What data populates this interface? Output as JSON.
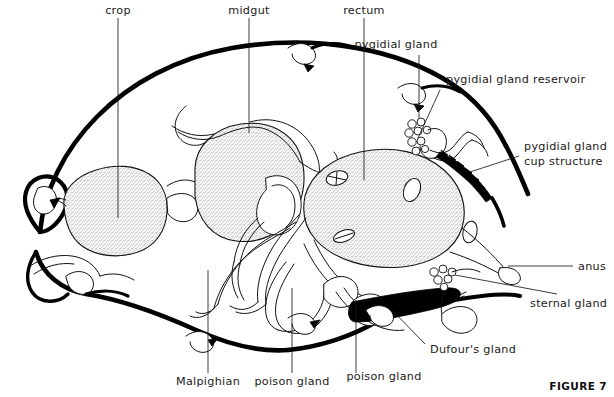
{
  "figure": {
    "caption": "FIGURE 7"
  },
  "labels": {
    "crop": "crop",
    "midgut": "midgut",
    "rectum": "rectum",
    "pygidial_gland": "pygidial gland",
    "pygidial_gland_reservoir": "pygidial gland  reservoir",
    "pygidial_gland_cup_line1": "pygidial gland",
    "pygidial_gland_cup_line2": "cup structure",
    "anus": "anus",
    "sternal_gland": "sternal gland",
    "dufours_gland": "Dufour's gland",
    "malpighian": "Malpighian",
    "poison_gland_left": "poison gland",
    "poison_gland_right": "poison gland"
  },
  "colors": {
    "ink": "#000000",
    "label_text": "#1a1a1a",
    "stipple_fill": "#d9d9d9",
    "background": "#ffffff",
    "solid_gland": "#000000"
  },
  "structures": [
    {
      "name": "crop",
      "fill": "stippled"
    },
    {
      "name": "midgut",
      "fill": "stippled"
    },
    {
      "name": "rectum",
      "fill": "stippled"
    },
    {
      "name": "pygidial-gland",
      "fill": "acinar-cluster"
    },
    {
      "name": "pygidial-gland-reservoir",
      "fill": "outline"
    },
    {
      "name": "pygidial-gland-cup-structure",
      "fill": "solid-black-serrated"
    },
    {
      "name": "sternal-gland",
      "fill": "acinar-cluster"
    },
    {
      "name": "dufours-gland",
      "fill": "solid-black"
    },
    {
      "name": "malpighian-tubules",
      "fill": "outline"
    },
    {
      "name": "poison-gland",
      "fill": "outline"
    },
    {
      "name": "anus",
      "fill": "outline"
    }
  ]
}
